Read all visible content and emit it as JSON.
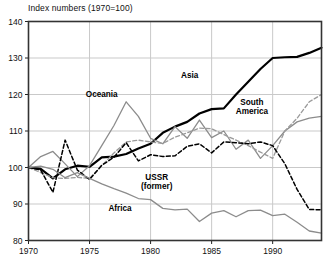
{
  "chart_data": {
    "type": "line",
    "title": "Index numbers (1970=100)",
    "xlabel": "",
    "ylabel": "",
    "ylim": [
      80,
      140
    ],
    "yticks": [
      80,
      90,
      100,
      110,
      120,
      130,
      140
    ],
    "xlim": [
      1970,
      1994
    ],
    "xticks": [
      1970,
      1975,
      1980,
      1985,
      1990
    ],
    "grid": true,
    "legend_position": "inline-labels",
    "x": [
      1970,
      1971,
      1972,
      1973,
      1974,
      1975,
      1976,
      1977,
      1978,
      1979,
      1980,
      1981,
      1982,
      1983,
      1984,
      1985,
      1986,
      1987,
      1988,
      1989,
      1990,
      1991,
      1992,
      1993,
      1994
    ],
    "series": [
      {
        "name": "Asia",
        "label": "Asia",
        "style": "solid",
        "color": "#000000",
        "width": 2.2,
        "label_x": 1983.2,
        "label_y": 124.5,
        "values": [
          100,
          99.6,
          97.0,
          99.5,
          100.5,
          100.2,
          102.8,
          103.0,
          103.7,
          105.2,
          106.5,
          109.5,
          111.2,
          112.5,
          114.8,
          116.0,
          116.2,
          120.0,
          123.5,
          127.0,
          130.0,
          130.2,
          130.3,
          131.4,
          132.8
        ]
      },
      {
        "name": "Oceania",
        "label": "Oceania",
        "style": "solid",
        "color": "#8c8c8c",
        "width": 1.3,
        "label_x": 1976.0,
        "label_y": 119.2,
        "values": [
          100,
          103.0,
          104.4,
          101.0,
          97.5,
          100.5,
          106.0,
          111.5,
          118.0,
          114.0,
          108.0,
          106.5,
          111.2,
          108.0,
          113.0,
          108.2,
          110.0,
          105.0,
          107.5,
          102.5,
          106.0,
          110.0,
          112.5,
          113.5,
          114.0
        ]
      },
      {
        "name": "South America",
        "label": "South\nAmerica",
        "style": "dashed",
        "color": "#9a9a9a",
        "width": 1.3,
        "label_x": 1988.3,
        "label_y": 117.2,
        "values": [
          100,
          98.6,
          97.2,
          97.0,
          97.3,
          97.0,
          100.5,
          104.0,
          107.0,
          107.5,
          107.0,
          106.6,
          108.3,
          109.5,
          110.8,
          110.6,
          109.0,
          107.5,
          106.0,
          104.2,
          102.5,
          110.0,
          113.5,
          118.0,
          120.0
        ]
      },
      {
        "name": "USSR (former)",
        "label": "USSR\n(former)",
        "style": "dashed",
        "color": "#000000",
        "width": 1.5,
        "label_x": 1980.5,
        "label_y": 96.6,
        "values": [
          100,
          99.3,
          93.2,
          107.5,
          99.3,
          96.7,
          100.6,
          102.8,
          106.8,
          101.8,
          103.5,
          103.0,
          103.2,
          105.8,
          106.5,
          104.0,
          107.0,
          106.8,
          106.5,
          107.0,
          106.0,
          101.0,
          94.0,
          88.5,
          88.4
        ]
      },
      {
        "name": "Africa",
        "label": "Africa",
        "style": "solid",
        "color": "#8c8c8c",
        "width": 1.3,
        "label_x": 1977.5,
        "label_y": 88.2,
        "values": [
          100,
          100.4,
          99.5,
          97.2,
          98.6,
          97.0,
          95.5,
          94.2,
          93.0,
          91.5,
          91.2,
          88.8,
          88.4,
          88.6,
          85.2,
          87.5,
          88.2,
          86.5,
          88.2,
          88.3,
          86.8,
          87.2,
          85.0,
          82.6,
          82.0
        ]
      }
    ]
  }
}
